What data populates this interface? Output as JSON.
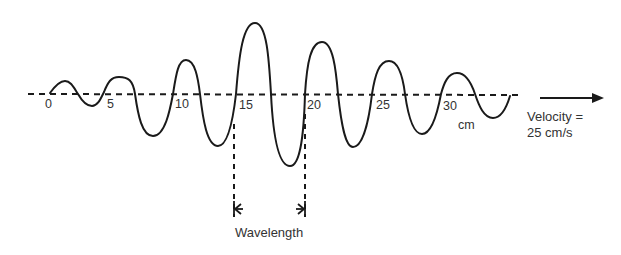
{
  "diagram": {
    "title": "",
    "axis": {
      "unit_label": "cm",
      "ticks": [
        {
          "label": "0",
          "x": 45
        },
        {
          "label": "5",
          "x": 107
        },
        {
          "label": "10",
          "x": 175
        },
        {
          "label": "15",
          "x": 239
        },
        {
          "label": "20",
          "x": 307
        },
        {
          "label": "25",
          "x": 374
        },
        {
          "label": "30",
          "x": 443
        }
      ]
    },
    "wave": {
      "description": "Transverse wave with amplitude growing to a maximum near 15–20 cm, then decaying",
      "stroke_color": "#1a1a1a"
    },
    "velocity": {
      "line1": "Velocity =",
      "line2": "25 cm/s",
      "direction": "right"
    },
    "wavelength": {
      "label": "Wavelength",
      "from_tick": "15",
      "to_tick": "20"
    }
  }
}
